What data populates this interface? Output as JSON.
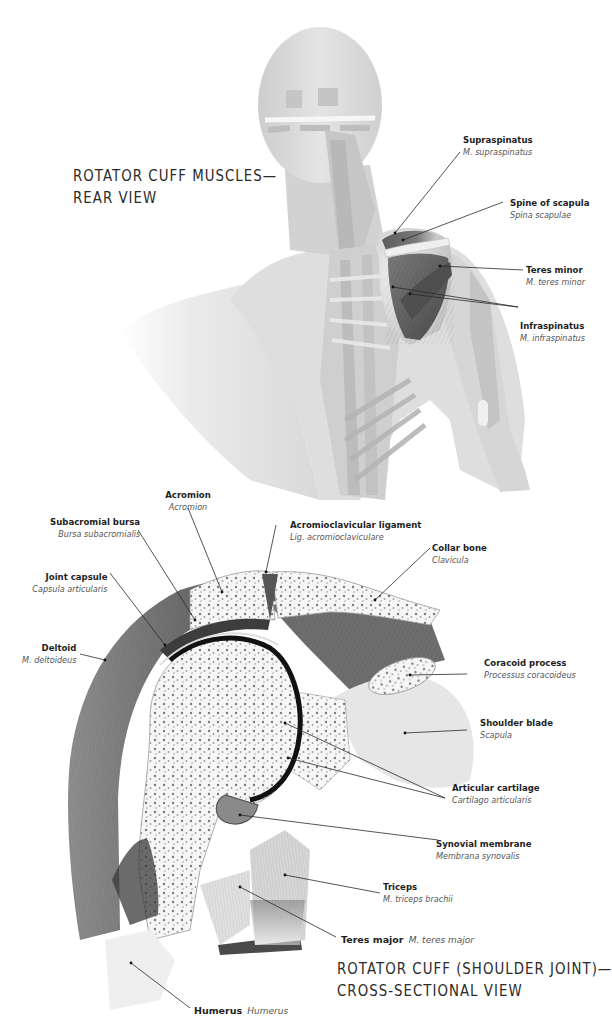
{
  "figure_top": {
    "title_line1": "ROTATOR CUFF MUSCLES—",
    "title_line2": "REAR VIEW",
    "labels": [
      {
        "id": "supraspinatus",
        "name": "Supraspinatus",
        "latin": "M. supraspinatus"
      },
      {
        "id": "spine-of-scapula",
        "name": "Spine of scapula",
        "latin": "Spina scapulae"
      },
      {
        "id": "teres-minor",
        "name": "Teres minor",
        "latin": "M. teres minor"
      },
      {
        "id": "infraspinatus",
        "name": "Infraspinatus",
        "latin": "M. infraspinatus"
      }
    ]
  },
  "figure_bottom": {
    "title_line1": "ROTATOR CUFF (SHOULDER JOINT)—",
    "title_line2": "CROSS-SECTIONAL VIEW",
    "labels": [
      {
        "id": "acromion",
        "name": "Acromion",
        "latin": "Acromion"
      },
      {
        "id": "subacromial-bursa",
        "name": "Subacromial bursa",
        "latin": "Bursa subacromialis"
      },
      {
        "id": "acromioclavicular-ligament",
        "name": "Acromioclavicular ligament",
        "latin": "Lig. acromioclaviculare"
      },
      {
        "id": "joint-capsule",
        "name": "Joint capsule",
        "latin": "Capsula articularis"
      },
      {
        "id": "collar-bone",
        "name": "Collar bone",
        "latin": "Clavicula"
      },
      {
        "id": "deltoid",
        "name": "Deltoid",
        "latin": "M. deltoideus"
      },
      {
        "id": "coracoid-process",
        "name": "Coracoid process",
        "latin": "Processus coracoideus"
      },
      {
        "id": "shoulder-blade",
        "name": "Shoulder blade",
        "latin": "Scapula"
      },
      {
        "id": "articular-cartilage",
        "name": "Articular cartilage",
        "latin": "Cartilago articularis"
      },
      {
        "id": "synovial-membrane",
        "name": "Synovial membrane",
        "latin": "Membrana synovalis"
      },
      {
        "id": "triceps",
        "name": "Triceps",
        "latin": "M. triceps brachii"
      },
      {
        "id": "teres-major",
        "name": "Teres major",
        "latin": "M. teres major"
      },
      {
        "id": "humerus",
        "name": "Humerus",
        "latin": "Humerus"
      }
    ]
  },
  "colors": {
    "background": "#ffffff",
    "muscle_dark": "#5a5a5a",
    "muscle_light": "#d4d4d4",
    "bone": "#f4f4f4",
    "cartilage": "#111111",
    "leader_line": "#2a2a2a"
  }
}
